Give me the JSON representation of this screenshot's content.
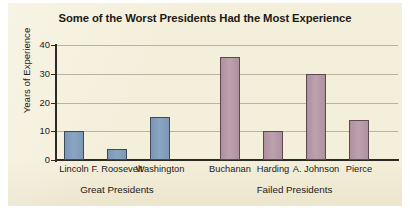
{
  "chart_data": {
    "type": "bar",
    "title": "Some of the Worst Presidents Had the Most Experience",
    "xlabel": "",
    "ylabel": "Years of Experience",
    "ylim": [
      0,
      40
    ],
    "yticks": [
      "0",
      "10",
      "20",
      "30",
      "40"
    ],
    "grid": true,
    "legend": "none",
    "categories": [
      "Lincoln",
      "F. Roosevelt",
      "Washington",
      "Buchanan",
      "Harding",
      "A. Johnson",
      "Pierce"
    ],
    "values": [
      10,
      4,
      15,
      36,
      10,
      30,
      14
    ],
    "bar_colors": [
      "#8ba6c3",
      "#8ba6c3",
      "#8ba6c3",
      "#bda1ae",
      "#bda1ae",
      "#bda1ae",
      "#bda1ae"
    ],
    "groups": [
      {
        "label": "Great Presidents",
        "categories": [
          "Lincoln",
          "F. Roosevelt",
          "Washington"
        ]
      },
      {
        "label": "Failed Presidents",
        "categories": [
          "Buchanan",
          "Harding",
          "A. Johnson",
          "Pierce"
        ]
      }
    ],
    "bars": [
      {
        "label": "Lincoln",
        "value": 10,
        "color": "#8ba6c3",
        "group": "Great Presidents"
      },
      {
        "label": "F. Roosevelt",
        "value": 4,
        "color": "#8ba6c3",
        "group": "Great Presidents"
      },
      {
        "label": "Washington",
        "value": 15,
        "color": "#8ba6c3",
        "group": "Great Presidents"
      },
      {
        "label": "Buchanan",
        "value": 36,
        "color": "#bda1ae",
        "group": "Failed Presidents"
      },
      {
        "label": "Harding",
        "value": 10,
        "color": "#bda1ae",
        "group": "Failed Presidents"
      },
      {
        "label": "A. Johnson",
        "value": 30,
        "color": "#bda1ae",
        "group": "Failed Presidents"
      },
      {
        "label": "Pierce",
        "value": 14,
        "color": "#bda1ae",
        "group": "Failed Presidents"
      }
    ]
  },
  "figure": {
    "background_color": "#f4efda",
    "axis_color": "#2d2a24",
    "grid_color": "#b9b3a0",
    "text_color": "#22201c"
  }
}
